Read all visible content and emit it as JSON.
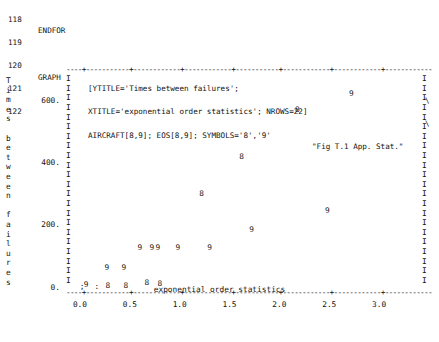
{
  "code_listing": {
    "lines": [
      {
        "num": "118",
        "keyword": "ENDFOR",
        "text": "",
        "cont": "",
        "caption": ""
      },
      {
        "num": "119",
        "keyword": "",
        "text": "",
        "cont": "",
        "caption": ""
      },
      {
        "num": "120",
        "keyword": "GRAPH",
        "text": "[YTITLE='Times between failures';",
        "cont": "\\",
        "caption": ""
      },
      {
        "num": "121",
        "keyword": "",
        "text": "XTITLE='exponential order statistics'; NROWS=22]",
        "cont": "\\",
        "caption": ""
      },
      {
        "num": "122",
        "keyword": "",
        "text": "AIRCRAFT[8,9]; EOS[8,9]; SYMBOLS='8','9'",
        "cont": "",
        "caption": "\"Fig T.1 App. Stat.\""
      }
    ]
  },
  "chart_data": {
    "type": "scatter",
    "title": "",
    "xlabel": "exponential order statistics",
    "ylabel": "Times between failures",
    "ylabel_chars": [
      "T",
      "i",
      "m",
      "e",
      "s",
      "",
      "b",
      "e",
      "t",
      "w",
      "e",
      "e",
      "n",
      "",
      "f",
      "a",
      "i",
      "l",
      "u",
      "r",
      "e",
      "s"
    ],
    "xticks": [
      "0.0",
      "0.5",
      "1.0",
      "1.5",
      "2.0",
      "2.5",
      "3.0"
    ],
    "xtick_values": [
      0.0,
      0.5,
      1.0,
      1.5,
      2.0,
      2.5,
      3.0
    ],
    "yticks": [
      "600.",
      "400.",
      "200.",
      "0."
    ],
    "ytick_values": [
      600,
      400,
      200,
      0
    ],
    "xlim": [
      -0.12,
      3.45
    ],
    "ylim": [
      -15,
      700
    ],
    "grid": false,
    "legend": "none",
    "axis_style": "ascii-characters",
    "border_chars": {
      "horizontal": "-",
      "tick": "+",
      "vertical": "I"
    },
    "series": [
      {
        "name": "8",
        "symbol": "8",
        "points": [
          {
            "x": 0.28,
            "y": 6
          },
          {
            "x": 0.46,
            "y": 6
          },
          {
            "x": 0.67,
            "y": 14
          },
          {
            "x": 0.8,
            "y": 12
          },
          {
            "x": 1.22,
            "y": 300
          },
          {
            "x": 1.62,
            "y": 420
          },
          {
            "x": 2.18,
            "y": 570
          }
        ]
      },
      {
        "name": "9",
        "symbol": "9",
        "points": [
          {
            "x": 0.06,
            "y": 10
          },
          {
            "x": 0.27,
            "y": 62
          },
          {
            "x": 0.44,
            "y": 62
          },
          {
            "x": 0.6,
            "y": 128
          },
          {
            "x": 0.72,
            "y": 128
          },
          {
            "x": 0.78,
            "y": 128
          },
          {
            "x": 0.98,
            "y": 128
          },
          {
            "x": 1.3,
            "y": 128
          },
          {
            "x": 1.72,
            "y": 185
          },
          {
            "x": 2.48,
            "y": 245
          },
          {
            "x": 2.72,
            "y": 620
          }
        ]
      }
    ],
    "extra_marks": [
      {
        "symbol": ";",
        "x": 0.02,
        "y": 3
      },
      {
        "symbol": ":",
        "x": 0.17,
        "y": 3
      }
    ]
  }
}
